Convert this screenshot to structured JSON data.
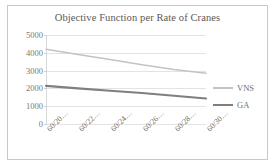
{
  "chart_data": {
    "type": "line",
    "title": "Objective Function per Rate of Cranes",
    "xlabel": "",
    "ylabel": "",
    "categories": [
      "60/20…",
      "60/22…",
      "60/24…",
      "60/26…",
      "60/28…",
      "60/30…"
    ],
    "ylim": [
      0,
      5000
    ],
    "yticks": [
      0,
      1000,
      2000,
      3000,
      4000,
      5000
    ],
    "ytick_labels": [
      "0",
      "1000",
      "2000",
      "3000",
      "4000",
      "5000"
    ],
    "grid": true,
    "legend_position": "right",
    "series": [
      {
        "name": "VNS",
        "color": "#c3c3c3",
        "values": [
          4200,
          3910,
          3620,
          3330,
          3060,
          2850
        ]
      },
      {
        "name": "GA",
        "color": "#7f7f7f",
        "values": [
          2140,
          2000,
          1870,
          1740,
          1590,
          1430
        ]
      }
    ]
  },
  "frame": {
    "border_color": "#c8c8c8",
    "background": "#ffffff"
  }
}
